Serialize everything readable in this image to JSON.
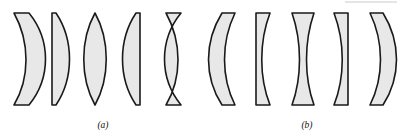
{
  "figure": {
    "width": 410,
    "height": 136,
    "background_color": "#ffffff",
    "lens_fill_color": "#e8e8e8",
    "lens_stroke_color": "#1a1a1a"
  },
  "groups": [
    {
      "id": "a",
      "caption": "(a)",
      "caption_x": 103,
      "caption_y": 128,
      "description": "converging (positive) lenses",
      "lenses": [
        {
          "name": "positive-meniscus",
          "label": "positive meniscus",
          "path": "M 14 13 C 30 42 30 78 14 105 L 29 105 C 51 78 51 40 29 13 Z"
        },
        {
          "name": "plano-convex",
          "label": "plano-convex",
          "path": "M 52 13 L 52 105 L 56 105 C 74 78 74 40 56 13 Z"
        },
        {
          "name": "biconvex",
          "label": "biconvex",
          "path": "M 95 13 C 80 40 80 78 95 105 C 110 78 110 40 95 13 Z"
        },
        {
          "name": "convex-plano",
          "label": "convex-plano",
          "path": "M 136 13 C 118 40 118 78 136 105 L 140 105 L 140 13 Z"
        },
        {
          "name": "positive-meniscus-reversed",
          "label": "positive meniscus reversed",
          "path": "M 181 13 C 159 40 159 78 181 105 L 166 105 C 182 78 182 42 166 13 Z"
        }
      ]
    },
    {
      "id": "b",
      "caption": "(b)",
      "caption_x": 307,
      "caption_y": 128,
      "description": "diverging (negative) lenses",
      "lenses": [
        {
          "name": "negative-meniscus",
          "label": "negative meniscus",
          "path": "M 222 13 C 204 42 204 77 222 105 L 235 105 C 221 77 221 42 235 13 Z"
        },
        {
          "name": "plano-concave",
          "label": "plano-concave",
          "path": "M 256 13 L 256 105 L 270 105 C 259 77 259 42 270 13 Z"
        },
        {
          "name": "biconcave",
          "label": "biconcave",
          "path": "M 292 13 C 302 42 302 77 292 105 L 314 105 C 304 77 304 42 314 13 Z"
        },
        {
          "name": "concave-plano",
          "label": "concave-plano",
          "path": "M 334 13 C 345 42 345 77 334 105 L 348 105 L 348 13 Z"
        },
        {
          "name": "negative-meniscus-reversed",
          "label": "negative meniscus reversed",
          "path": "M 370 13 C 384 42 384 77 370 105 L 383 105 C 401 77 401 42 383 13 Z"
        }
      ]
    }
  ]
}
